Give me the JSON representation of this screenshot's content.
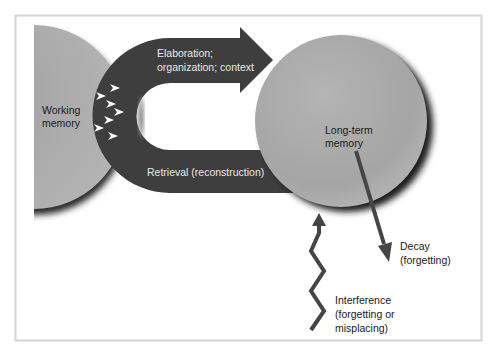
{
  "diagram": {
    "colors": {
      "band": "#3e3e3e",
      "circle": "#a9a9a9",
      "arrow": "#454545",
      "frame": "#d4d4d4",
      "chevron": "#ffffff"
    },
    "nodes": {
      "working_memory": {
        "line1": "Working",
        "line2": "memory"
      },
      "long_term_memory": {
        "line1": "Long-term",
        "line2": "memory"
      }
    },
    "flows": {
      "encoding": {
        "line1": "Elaboration;",
        "line2": "organization; context"
      },
      "retrieval": {
        "label": "Retrieval (reconstruction)"
      },
      "decay": {
        "line1": "Decay",
        "line2": "(forgetting)"
      },
      "interference": {
        "line1": "Interference",
        "line2": "(forgetting or",
        "line3": "misplacing)"
      }
    },
    "chevron_count": 7
  }
}
